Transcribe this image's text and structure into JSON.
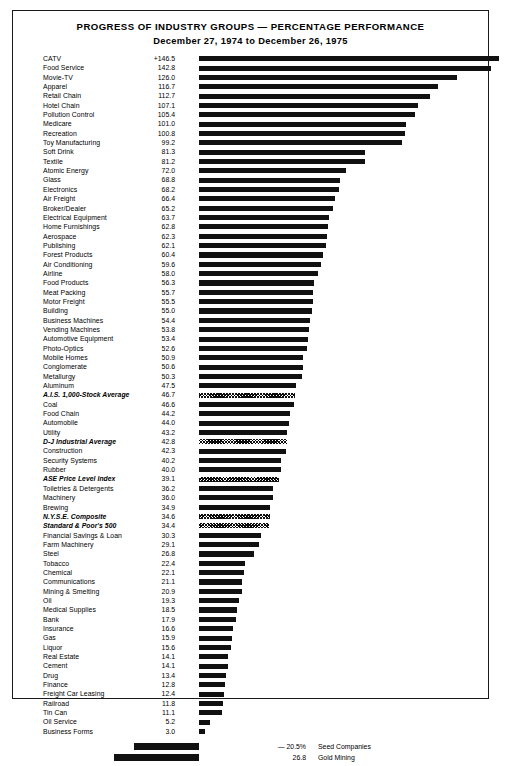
{
  "chart": {
    "title": "PROGRESS OF INDUSTRY GROUPS — PERCENTAGE PERFORMANCE",
    "subtitle": "December 27, 1974 to December 26, 1975"
  },
  "chart_data": {
    "type": "bar",
    "orientation": "horizontal",
    "title": "PROGRESS OF INDUSTRY GROUPS — PERCENTAGE PERFORMANCE",
    "subtitle": "December 27, 1974 to December 26, 1975",
    "xlabel": "",
    "ylabel": "",
    "xlim": [
      -30,
      150
    ],
    "grid": false,
    "legend": false,
    "value_unit": "percent",
    "categories": [
      "CATV",
      "Food Service",
      "Movie-TV",
      "Apparel",
      "Retail Chain",
      "Hotel Chain",
      "Pollution Control",
      "Medicare",
      "Recreation",
      "Toy Manufacturing",
      "Soft Drink",
      "Textile",
      "Atomic Energy",
      "Glass",
      "Electronics",
      "Air Freight",
      "Broker/Dealer",
      "Electrical Equipment",
      "Home Furnishings",
      "Aerospace",
      "Publishing",
      "Forest Products",
      "Air Conditioning",
      "Airline",
      "Food Products",
      "Meat Packing",
      "Motor Freight",
      "Building",
      "Business Machines",
      "Vending Machines",
      "Automotive Equipment",
      "Photo-Optics",
      "Mobile Homes",
      "Conglomerate",
      "Metallurgy",
      "Aluminum",
      "A.I.S. 1,000-Stock Average",
      "Coal",
      "Food Chain",
      "Automobile",
      "Utility",
      "D-J Industrial Average",
      "Construction",
      "Security Systems",
      "Rubber",
      "ASE Price Level Index",
      "Toiletries & Detergents",
      "Machinery",
      "Brewing",
      "N.Y.S.E. Composite",
      "Standard & Poor's 500",
      "Financial Savings & Loan",
      "Farm Machinery",
      "Steel",
      "Tobacco",
      "Chemical",
      "Communications",
      "Mining & Smelting",
      "Oil",
      "Medical Supplies",
      "Bank",
      "Insurance",
      "Gas",
      "Liquor",
      "Real Estate",
      "Cement",
      "Drug",
      "Finance",
      "Freight Car Leasing",
      "Railroad",
      "Tin Can",
      "Oil Service",
      "Business Forms"
    ],
    "values": [
      146.5,
      142.8,
      126.0,
      116.7,
      112.7,
      107.1,
      105.4,
      101.0,
      100.8,
      99.2,
      81.3,
      81.2,
      72.0,
      68.8,
      68.2,
      66.4,
      65.2,
      63.7,
      62.8,
      62.3,
      62.1,
      60.4,
      59.6,
      58.0,
      56.3,
      55.7,
      55.5,
      55.0,
      54.4,
      53.8,
      53.4,
      52.6,
      50.9,
      50.6,
      50.3,
      47.5,
      46.7,
      46.6,
      44.2,
      44.0,
      43.2,
      42.8,
      42.3,
      40.2,
      40.0,
      39.1,
      36.2,
      36.0,
      34.9,
      34.6,
      34.4,
      30.3,
      29.1,
      26.8,
      22.4,
      22.1,
      21.1,
      20.9,
      19.3,
      18.5,
      17.9,
      16.6,
      15.9,
      15.6,
      14.1,
      14.1,
      13.4,
      12.8,
      12.4,
      11.8,
      11.1,
      5.2,
      3.0
    ],
    "value_labels": [
      "+146.5",
      "142.8",
      "126.0",
      "116.7",
      "112.7",
      "107.1",
      "105.4",
      "101.0",
      "100.8",
      "99.2",
      "81.3",
      "81.2",
      "72.0",
      "68.8",
      "68.2",
      "66.4",
      "65.2",
      "63.7",
      "62.8",
      "62.3",
      "62.1",
      "60.4",
      "59.6",
      "58.0",
      "56.3",
      "55.7",
      "55.5",
      "55.0",
      "54.4",
      "53.8",
      "53.4",
      "52.6",
      "50.9",
      "50.6",
      "50.3",
      "47.5",
      "46.7",
      "46.6",
      "44.2",
      "44.0",
      "43.2",
      "42.8",
      "42.3",
      "40.2",
      "40.0",
      "39.1",
      "36.2",
      "36.0",
      "34.9",
      "34.6",
      "34.4",
      "30.3",
      "29.1",
      "26.8",
      "22.4",
      "22.1",
      "21.1",
      "20.9",
      "19.3",
      "18.5",
      "17.9",
      "16.6",
      "15.9",
      "15.6",
      "14.1",
      "14.1",
      "13.4",
      "12.8",
      "12.4",
      "11.8",
      "11.1",
      "5.2",
      "3.0"
    ],
    "index_rows": [
      "A.I.S. 1,000-Stock Average",
      "D-J Industrial Average",
      "ASE Price Level Index",
      "N.Y.S.E. Composite",
      "Standard & Poor's 500"
    ],
    "negative": {
      "categories": [
        "Seed Companies",
        "Gold Mining"
      ],
      "values": [
        -20.5,
        -26.8
      ],
      "value_labels": [
        "— 20.5%",
        "26.8"
      ]
    }
  }
}
